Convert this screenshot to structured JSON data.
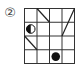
{
  "puzzle": {
    "label": "②",
    "rows": 4,
    "cols": 4,
    "diagonals": [
      {
        "from": [
          0,
          1
        ],
        "to": [
          1,
          2
        ],
        "dir": "backslash"
      },
      {
        "from": [
          0,
          4
        ],
        "to": [
          2,
          3
        ],
        "dir": "slash"
      },
      {
        "from": [
          2,
          0
        ],
        "to": [
          3,
          1
        ],
        "dir": "backslash"
      }
    ],
    "circles": [
      {
        "row": 1,
        "col": 0,
        "type": "half-black-left"
      },
      {
        "row": 3,
        "col": 2,
        "type": "black"
      }
    ],
    "colors": {
      "line": "#222222",
      "grid": "#333333",
      "fill": "#111111"
    }
  }
}
